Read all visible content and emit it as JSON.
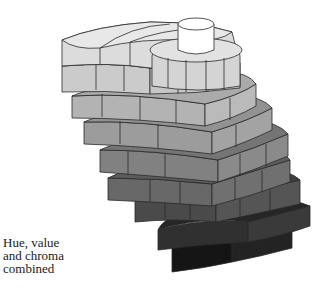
{
  "caption": {
    "lines": [
      "Hue, value",
      "and chroma",
      "combined"
    ]
  },
  "figure": {
    "colors": {
      "top_core": "#ffffff",
      "outline": "#2a2a2a",
      "tiers": [
        "#e6e6e6",
        "#d2d2d2",
        "#bdbdbd",
        "#a6a6a6",
        "#8f8f8f",
        "#777777",
        "#5e5e5e",
        "#444444",
        "#2c2c2c",
        "#161616"
      ]
    }
  }
}
